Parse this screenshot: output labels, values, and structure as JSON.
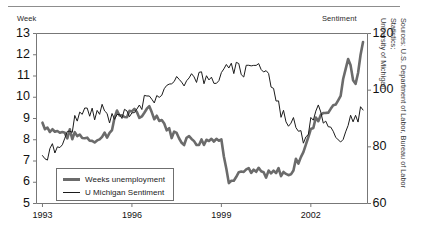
{
  "figure": {
    "source_note": "Sources: U.S. Department of Labor, Bureau of Labor Statistics;\nUniversity of Michigan"
  },
  "chart_data": {
    "type": "line",
    "title": "",
    "xlabel": "",
    "ylabel": "Week",
    "y2label": "Sentiment",
    "grid": false,
    "legend_position": "inside-lower-left",
    "x": [
      1993.0,
      1993.25,
      1993.5,
      1993.75,
      1994.0,
      1994.25,
      1994.5,
      1994.75,
      1995.0,
      1995.25,
      1995.5,
      1995.75,
      1996.0,
      1996.25,
      1996.5,
      1996.75,
      1997.0,
      1997.25,
      1997.5,
      1997.75,
      1998.0,
      1998.25,
      1998.5,
      1998.75,
      1999.0,
      1999.25,
      1999.5,
      1999.75,
      2000.0,
      2000.25,
      2000.5,
      2000.75,
      2001.0,
      2001.25,
      2001.5,
      2001.75,
      2002.0,
      2002.25,
      2002.5,
      2002.75,
      2003.0,
      2003.25,
      2003.5,
      2003.75
    ],
    "xlim": [
      1992.8,
      2003.9
    ],
    "ylim": [
      5,
      13
    ],
    "y2lim": [
      60,
      120
    ],
    "xticks": [
      1993,
      1996,
      1999,
      2002
    ],
    "xticklabels": [
      "1993",
      "1996",
      "1999",
      "2002"
    ],
    "yticks": [
      5,
      6,
      7,
      8,
      9,
      10,
      11,
      12,
      13
    ],
    "yticklabels": [
      "5",
      "6",
      "7",
      "8",
      "9",
      "10",
      "11",
      "12",
      "13"
    ],
    "y2ticks": [
      60,
      80,
      100,
      120
    ],
    "y2ticklabels": [
      "60",
      "80",
      "100",
      "120"
    ],
    "series": [
      {
        "name": "Weeks unemployment",
        "axis": "left",
        "color": "#6b6b6b",
        "width": 2.6,
        "values": [
          8.8,
          8.5,
          8.4,
          8.3,
          8.2,
          8.2,
          8.1,
          8.0,
          8.1,
          8.4,
          9.2,
          9.1,
          9.4,
          8.9,
          9.6,
          9.2,
          8.9,
          8.4,
          8.2,
          8.0,
          8.1,
          7.9,
          8.0,
          8.1,
          7.9,
          6.2,
          6.3,
          6.6,
          6.4,
          6.5,
          6.3,
          6.4,
          6.5,
          6.3,
          6.9,
          7.5,
          8.4,
          9.1,
          9.4,
          9.5,
          10.2,
          11.9,
          10.4,
          12.6
        ]
      },
      {
        "name": "U Michigan Sentiment",
        "axis": "right",
        "color": "#1b1b1b",
        "width": 1.0,
        "values": [
          77,
          78,
          80,
          82,
          88,
          91,
          92,
          91,
          93,
          90,
          92,
          91,
          94,
          95,
          96,
          97,
          100,
          101,
          103,
          104,
          106,
          105,
          104,
          103,
          106,
          107,
          108,
          106,
          110,
          109,
          107,
          100,
          92,
          90,
          88,
          82,
          90,
          95,
          88,
          84,
          80,
          90,
          89,
          93
        ]
      }
    ],
    "legend": [
      "Weeks unemployment",
      "U Michigan Sentiment"
    ]
  }
}
